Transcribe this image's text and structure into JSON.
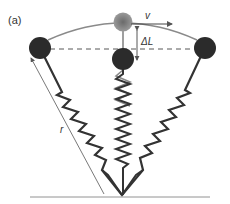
{
  "figure": {
    "panel_label": "(a)",
    "velocity_label": "v",
    "delta_label": "ΔL",
    "radius_label": "r"
  },
  "colors": {
    "ball_dark": "#2b2b2b",
    "ball_top": "#8a8a8a",
    "spring": "#3a3a3a",
    "arc": "#7a7a7a",
    "line": "#555555"
  }
}
